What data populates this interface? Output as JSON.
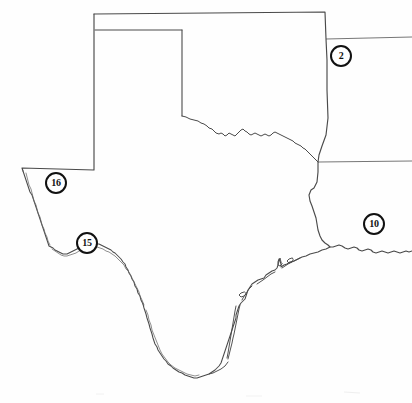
{
  "map": {
    "title": "Texas state outline map",
    "subject": "Texas",
    "background_color": "#ffffff",
    "outline_color": "#444444",
    "marker_color": "#111111",
    "description": "Black and white scanned outline map of the state of Texas with four numbered circular locator markers placed along its borders.",
    "neighbor_border_lines": [
      {
        "name": "northern-state-line",
        "description": "Horizontal line extending east from the northeast corner of the panhandle to the right edge."
      },
      {
        "name": "eastern-state-line",
        "description": "Horizontal line extending east from the eastern border at mid-height to the right edge."
      }
    ]
  },
  "markers": [
    {
      "id": "marker-2",
      "label": "2",
      "x": 330,
      "y": 45,
      "region": "northeast of panhandle"
    },
    {
      "id": "marker-16",
      "label": "16",
      "x": 45,
      "y": 172,
      "region": "west, near New Mexico border"
    },
    {
      "id": "marker-15",
      "label": "15",
      "x": 76,
      "y": 232,
      "region": "southwest, along the Rio Grande"
    },
    {
      "id": "marker-10",
      "label": "10",
      "x": 363,
      "y": 213,
      "region": "east, near the Louisiana border"
    }
  ]
}
